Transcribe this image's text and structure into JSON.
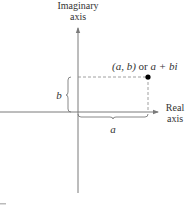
{
  "diagram": {
    "imaginary_axis_label": [
      "Imaginary",
      "axis"
    ],
    "real_axis_label": [
      "Real",
      "axis"
    ],
    "point_label": {
      "ordered_pair": "(a, b)",
      "connector": "or",
      "complex_form": "a + bi"
    },
    "horizontal_brace_label": "a",
    "vertical_brace_label": "b",
    "colors": {
      "axis": "#7a7a7a",
      "dashed_guide": "#888888",
      "point": "#000000",
      "text": "#333333"
    }
  }
}
